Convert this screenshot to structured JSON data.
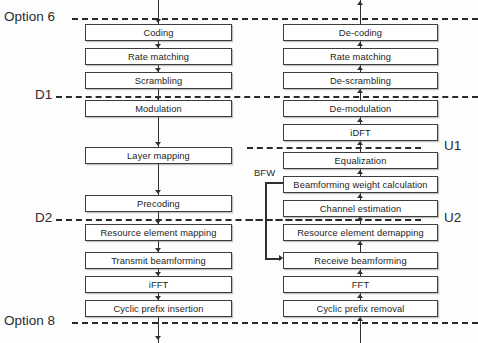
{
  "diagram": {
    "downlink_chain": [
      {
        "label": "Coding",
        "y": 24
      },
      {
        "label": "Rate matching",
        "y": 48
      },
      {
        "label": "Scrambling",
        "y": 72
      },
      {
        "label": "Modulation",
        "y": 100
      },
      {
        "label": "Layer mapping",
        "y": 147
      },
      {
        "label": "Precoding",
        "y": 195
      },
      {
        "label": "Resource element mapping",
        "y": 224
      },
      {
        "label": "Transmit beamforming",
        "y": 252
      },
      {
        "label": "iFFT",
        "y": 276
      },
      {
        "label": "Cyclic prefix insertion",
        "y": 300
      }
    ],
    "uplink_chain": [
      {
        "label": "De-coding",
        "y": 24
      },
      {
        "label": "Rate matching",
        "y": 48
      },
      {
        "label": "De-scrambling",
        "y": 72
      },
      {
        "label": "De-modulation",
        "y": 100
      },
      {
        "label": "iDFT",
        "y": 124
      },
      {
        "label": "Equalization",
        "y": 152
      },
      {
        "label": "Beamforming weight calculation",
        "y": 176
      },
      {
        "label": "Channel estimation",
        "y": 200
      },
      {
        "label": "Resource element demapping",
        "y": 224
      },
      {
        "label": "Receive beamforming",
        "y": 252
      },
      {
        "label": "FFT",
        "y": 276
      },
      {
        "label": "Cyclic prefix removal",
        "y": 300
      }
    ],
    "split_lines": [
      {
        "name": "option-6",
        "label": "Option 6",
        "y": 18,
        "side": "left"
      },
      {
        "name": "d1",
        "label": "D1",
        "y": 96,
        "side": "left"
      },
      {
        "name": "d2",
        "label": "D2",
        "y": 219,
        "side": "left"
      },
      {
        "name": "option-8",
        "label": "Option 8",
        "y": 322,
        "side": "left"
      },
      {
        "name": "u1",
        "label": "U1",
        "y": 147,
        "side": "right"
      },
      {
        "name": "u2",
        "label": "U2",
        "y": 219,
        "side": "right"
      }
    ],
    "feedback": {
      "label": "BFW",
      "from": "Beamforming weight calculation",
      "to": "Receive beamforming"
    },
    "colors": {
      "box_border": "#3d3d3d",
      "box_fill": "#ffffff",
      "line": "#2f2f2f",
      "dash": "#2a2a2a",
      "text": "#1d1d1d",
      "background": "#fdfdfd"
    }
  }
}
